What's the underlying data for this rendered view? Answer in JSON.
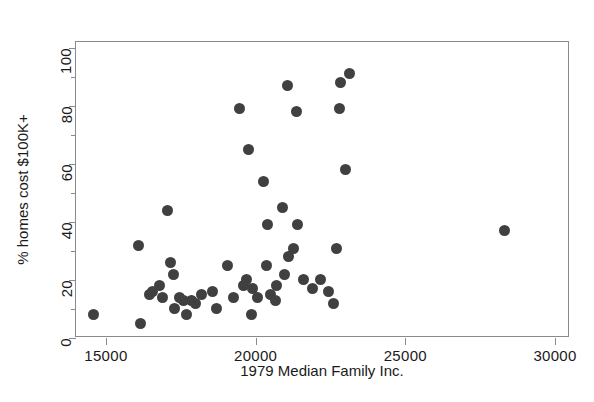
{
  "chart_data": {
    "type": "scatter",
    "title": "",
    "xlabel": "1979 Median Family Inc.",
    "ylabel": "% homes cost $100K+",
    "xlim": [
      14000,
      30500
    ],
    "ylim": [
      0,
      102
    ],
    "xticks": [
      15000,
      20000,
      25000,
      30000
    ],
    "xtick_labels": [
      "15000",
      "20000",
      "25000",
      "30000"
    ],
    "yticks": [
      0,
      20,
      40,
      60,
      80,
      100
    ],
    "ytick_labels": [
      "0",
      "20",
      "40",
      "60",
      "80",
      "100"
    ],
    "yticks_minor": [
      10,
      30,
      50,
      70,
      90
    ],
    "grid": false,
    "legend": null,
    "marker": {
      "shape": "circle",
      "color": "#404040",
      "size_px": 11
    },
    "frame_color": "#8a8a8a",
    "background": "#ffffff",
    "n_points": 50,
    "points": [
      {
        "x": 14600,
        "y": 8
      },
      {
        "x": 16100,
        "y": 32
      },
      {
        "x": 16150,
        "y": 5
      },
      {
        "x": 16450,
        "y": 15
      },
      {
        "x": 16550,
        "y": 16
      },
      {
        "x": 16800,
        "y": 18
      },
      {
        "x": 16900,
        "y": 14
      },
      {
        "x": 17050,
        "y": 44
      },
      {
        "x": 17150,
        "y": 26
      },
      {
        "x": 17250,
        "y": 22
      },
      {
        "x": 17300,
        "y": 10
      },
      {
        "x": 17450,
        "y": 14
      },
      {
        "x": 17600,
        "y": 13
      },
      {
        "x": 17700,
        "y": 8
      },
      {
        "x": 17850,
        "y": 13
      },
      {
        "x": 18000,
        "y": 12
      },
      {
        "x": 18200,
        "y": 15
      },
      {
        "x": 18550,
        "y": 16
      },
      {
        "x": 18700,
        "y": 10
      },
      {
        "x": 19050,
        "y": 25
      },
      {
        "x": 19250,
        "y": 14
      },
      {
        "x": 19450,
        "y": 79
      },
      {
        "x": 19600,
        "y": 18
      },
      {
        "x": 19700,
        "y": 20
      },
      {
        "x": 19750,
        "y": 65
      },
      {
        "x": 19850,
        "y": 8
      },
      {
        "x": 19900,
        "y": 17
      },
      {
        "x": 20050,
        "y": 14
      },
      {
        "x": 20250,
        "y": 54
      },
      {
        "x": 20350,
        "y": 25
      },
      {
        "x": 20400,
        "y": 39
      },
      {
        "x": 20500,
        "y": 15
      },
      {
        "x": 20650,
        "y": 13
      },
      {
        "x": 20700,
        "y": 18
      },
      {
        "x": 20900,
        "y": 45
      },
      {
        "x": 20950,
        "y": 22
      },
      {
        "x": 21050,
        "y": 87
      },
      {
        "x": 21100,
        "y": 28
      },
      {
        "x": 21250,
        "y": 31
      },
      {
        "x": 21350,
        "y": 78
      },
      {
        "x": 21400,
        "y": 39
      },
      {
        "x": 21600,
        "y": 20
      },
      {
        "x": 21900,
        "y": 17
      },
      {
        "x": 22150,
        "y": 20
      },
      {
        "x": 22450,
        "y": 16
      },
      {
        "x": 22600,
        "y": 12
      },
      {
        "x": 22700,
        "y": 31
      },
      {
        "x": 22800,
        "y": 79
      },
      {
        "x": 22850,
        "y": 88
      },
      {
        "x": 23000,
        "y": 58
      },
      {
        "x": 23150,
        "y": 91
      },
      {
        "x": 28300,
        "y": 37
      }
    ]
  }
}
